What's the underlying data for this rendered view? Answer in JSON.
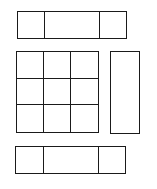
{
  "diagram": {
    "stroke_color": "#1a1a1a",
    "background": "#ffffff",
    "top_bar": {
      "cells": [
        {
          "id": "top-left",
          "label": ""
        },
        {
          "id": "top-middle",
          "label": ""
        },
        {
          "id": "top-right",
          "label": ""
        }
      ]
    },
    "grid": {
      "rows": 3,
      "cols": 3,
      "cells": [
        "",
        "",
        "",
        "",
        "",
        "",
        "",
        "",
        ""
      ]
    },
    "side_panel": {
      "label": ""
    },
    "bottom_bar": {
      "cells": [
        {
          "id": "bottom-left",
          "label": ""
        },
        {
          "id": "bottom-middle",
          "label": ""
        },
        {
          "id": "bottom-right",
          "label": ""
        }
      ]
    }
  }
}
